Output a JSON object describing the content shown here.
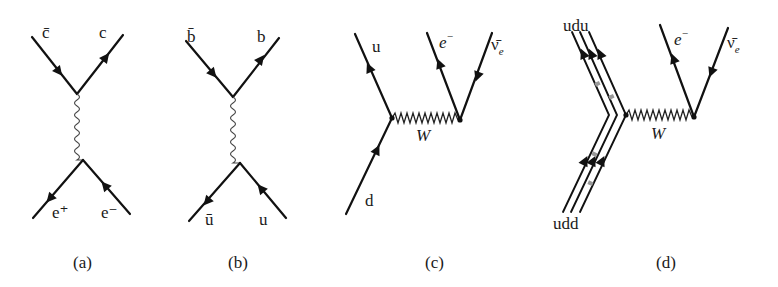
{
  "figure": {
    "panels": [
      {
        "id": "a",
        "caption": "(a)",
        "process": "e+ e- annihilation to c c-bar via photon",
        "labels": {
          "top_left": "c̄",
          "top_right": "c",
          "bottom_left": "e⁺",
          "bottom_right": "e⁻"
        },
        "propagator": "wavy"
      },
      {
        "id": "b",
        "caption": "(b)",
        "process": "u u-bar annihilation to b b-bar via photon",
        "labels": {
          "top_left": "b̄",
          "top_right": "b",
          "bottom_left": "ū",
          "bottom_right": "u"
        },
        "propagator": "wavy"
      },
      {
        "id": "c",
        "caption": "(c)",
        "process": "quark-level beta decay d → u e⁻ ν̄e",
        "labels": {
          "quark_in": "d",
          "quark_out": "u",
          "lepton": "e",
          "lepton_sup": "−",
          "neutrino": "ν̄",
          "neutrino_sub": "e",
          "boson": "W"
        },
        "propagator": "zigzag"
      },
      {
        "id": "d",
        "caption": "(d)",
        "process": "neutron beta decay udd → udu e⁻ ν̄e",
        "labels": {
          "hadron_in": "udd",
          "hadron_out": "udu",
          "lepton": "e",
          "lepton_sup": "−",
          "neutrino": "ν̄",
          "neutrino_sub": "e",
          "boson": "W"
        },
        "propagator": "zigzag"
      }
    ]
  }
}
